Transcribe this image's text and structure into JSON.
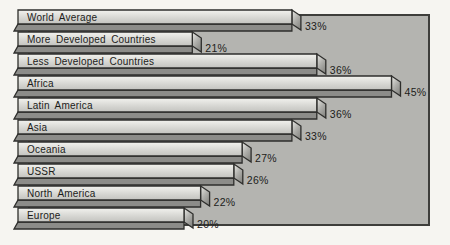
{
  "page": {
    "background_color": "#f6f5f1"
  },
  "chart_data": {
    "type": "bar",
    "orientation": "horizontal",
    "style": "3d-extruded-bars",
    "title": "",
    "xlabel": "",
    "ylabel": "",
    "xlim": [
      0,
      50
    ],
    "grid": false,
    "legend": "none",
    "categories": [
      "World Average",
      "More Developed Countries",
      "Less Developed Countries",
      "Africa",
      "Latin America",
      "Asia",
      "Oceania",
      "USSR",
      "North America",
      "Europe"
    ],
    "values": [
      33,
      21,
      36,
      45,
      36,
      33,
      27,
      26,
      22,
      20
    ],
    "value_labels": [
      "33%",
      "21%",
      "36%",
      "45%",
      "36%",
      "33%",
      "27%",
      "26%",
      "22%",
      "20%"
    ],
    "unit": "%",
    "panel_color": "#b4b4b0",
    "panel_border_color": "#3e3e3b",
    "bar_face_color": "#d8d8d4",
    "bar_shadow_color": "#8c8c89",
    "bar_cap_color": "#b0b0ac",
    "outline_color": "#2e2e2c",
    "text_color": "#1c1c1a"
  }
}
